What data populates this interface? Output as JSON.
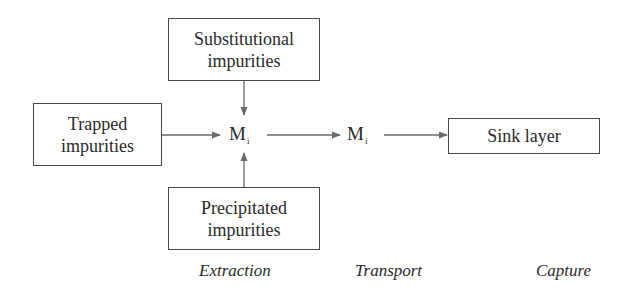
{
  "diagram": {
    "type": "flowchart",
    "boxes": {
      "substitutional": {
        "line1": "Substitutional",
        "line2": "impurities"
      },
      "trapped": {
        "line1": "Trapped",
        "line2": "impurities"
      },
      "precipitated": {
        "line1": "Precipitated",
        "line2": "impurities"
      },
      "sink": {
        "label": "Sink layer"
      }
    },
    "nodes": {
      "m1": {
        "symbol": "M",
        "subscript": "i"
      },
      "m2": {
        "symbol": "M",
        "subscript": "i"
      }
    },
    "stages": [
      "Extraction",
      "Transport",
      "Capture"
    ],
    "edges": [
      {
        "from": "Substitutional impurities",
        "to": "M_i"
      },
      {
        "from": "Trapped impurities",
        "to": "M_i"
      },
      {
        "from": "Precipitated impurities",
        "to": "M_i"
      },
      {
        "from": "M_i",
        "to": "M_i (transport)"
      },
      {
        "from": "M_i (transport)",
        "to": "Sink layer"
      }
    ],
    "colors": {
      "line": "#4a4a4a",
      "arrow": "#6a6a6a",
      "text": "#2a2a2a"
    }
  }
}
